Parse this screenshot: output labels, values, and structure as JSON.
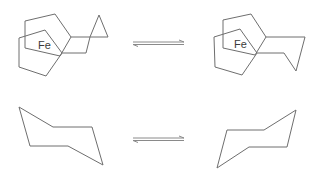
{
  "figure": {
    "colors": {
      "bond": "#6e6e6e",
      "arrow": "#8a8a8a",
      "label": "#3a3a3a",
      "background": "#ffffff"
    },
    "top_row": {
      "left_structure": {
        "metal_label": "Fe",
        "name": "ferrocene-fused-bicyclic-left"
      },
      "arrow": {
        "type": "equilibrium"
      },
      "right_structure": {
        "metal_label": "Fe",
        "name": "ferrocene-fused-bicyclic-right"
      }
    },
    "bottom_row": {
      "left_structure": {
        "name": "cyclohexane-chair-1"
      },
      "arrow": {
        "type": "equilibrium"
      },
      "right_structure": {
        "name": "cyclohexane-chair-2"
      }
    }
  }
}
